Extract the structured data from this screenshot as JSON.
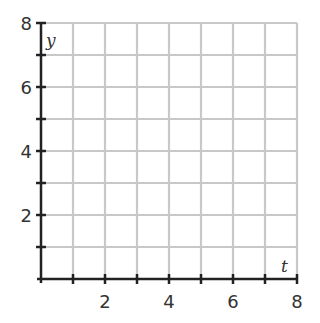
{
  "chart_data": {
    "type": "scatter",
    "title": "",
    "xlabel": "t",
    "ylabel": "y",
    "xlim": [
      0,
      8
    ],
    "ylim": [
      0,
      8
    ],
    "grid": true,
    "grid_step": 1,
    "x_ticks": [
      1,
      2,
      3,
      4,
      5,
      6,
      7,
      8
    ],
    "y_ticks": [
      1,
      2,
      3,
      4,
      5,
      6,
      7,
      8
    ],
    "x_tick_labels": [
      "2",
      "4",
      "6",
      "8"
    ],
    "y_tick_labels": [
      "2",
      "4",
      "6",
      "8"
    ],
    "series": [],
    "legend": null
  },
  "colors": {
    "grid": "#c8c8c8",
    "axis": "#222222",
    "text": "#333333"
  }
}
